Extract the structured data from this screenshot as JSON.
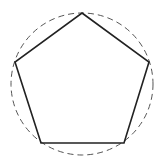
{
  "diagram": {
    "title": "",
    "circle": {
      "cx": 82,
      "cy": 84,
      "r": 71,
      "stroke": "#555555",
      "dash": "6,4"
    },
    "pentagon": {
      "points": "82,13 149,62 124,143 41,143 15,62",
      "stroke": "#222222"
    }
  }
}
